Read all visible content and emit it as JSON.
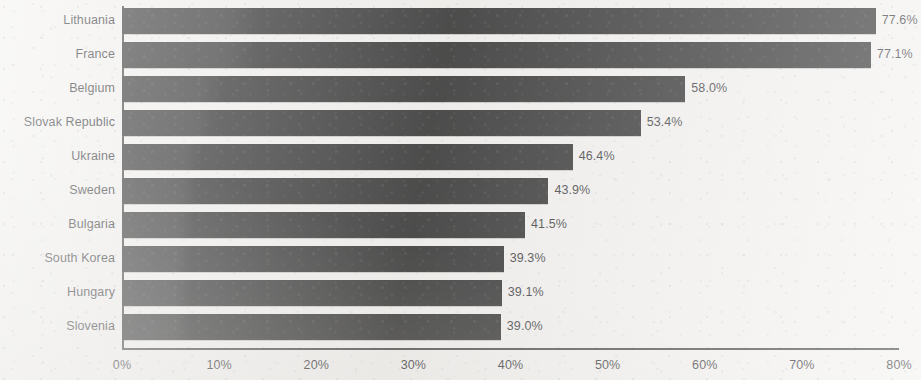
{
  "chart_data": {
    "type": "bar",
    "orientation": "horizontal",
    "title": "",
    "subtitle": "",
    "xlabel": "",
    "ylabel": "",
    "categories": [
      "Lithuania",
      "France",
      "Belgium",
      "Slovak Republic",
      "Ukraine",
      "Sweden",
      "Bulgaria",
      "South Korea",
      "Hungary",
      "Slovenia"
    ],
    "values": [
      77.6,
      77.1,
      58.0,
      53.4,
      46.4,
      43.9,
      41.5,
      39.3,
      39.1,
      39.0
    ],
    "value_labels": [
      "77.6%",
      "77.1%",
      "58.0%",
      "53.4%",
      "46.4%",
      "43.9%",
      "41.5%",
      "39.3%",
      "39.1%",
      "39.0%"
    ],
    "xlim": [
      0,
      80
    ],
    "x_tick_values": [
      0,
      10,
      20,
      30,
      40,
      50,
      60,
      70,
      80
    ],
    "x_tick_labels": [
      "0%",
      "10%",
      "20%",
      "30%",
      "40%",
      "50%",
      "60%",
      "70%",
      "80%"
    ],
    "grid": false,
    "legend": null,
    "bar_color": "#0b0b0c",
    "background_color": "#f1f0ee",
    "axis_color": "#2a2a2c",
    "text_color": "#141418"
  }
}
